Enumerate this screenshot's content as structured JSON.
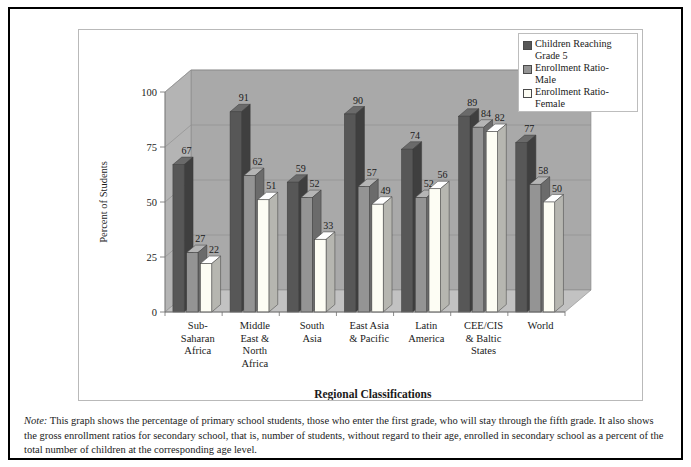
{
  "figure": {
    "x_axis_title": "Regional Classifications",
    "y_axis_title": "Percent of Students",
    "note_label": "Note:",
    "note_text": " This graph shows the percentage of primary school students, those who enter the first grade, who will stay through the fifth grade. It also shows the gross enrollment ratios for secondary school, that is, number of students, without regard to their age, enrolled in secondary school as a percent of the total number of children at the corresponding age level."
  },
  "legend": {
    "items": [
      {
        "label": "Children Reaching\nGrade 5",
        "color": "#575757",
        "name": "legend-children-reaching-grade-5"
      },
      {
        "label": "Enrollment Ratio-\nMale",
        "color": "#949494",
        "name": "legend-enrollment-ratio-male"
      },
      {
        "label": "Enrollment Ratio-\nFemale",
        "color": "#fdfdf4",
        "name": "legend-enrollment-ratio-female"
      }
    ]
  },
  "chart_data": {
    "type": "bar",
    "title": "",
    "subtitle": "",
    "xlabel": "Regional Classifications",
    "ylabel": "Percent of Students",
    "ylim": [
      0,
      100
    ],
    "yticks": [
      0,
      25,
      50,
      75,
      100
    ],
    "ytick_labels": [
      "0",
      "25",
      "50",
      "75",
      "100"
    ],
    "grid": true,
    "legend_position": "top-right",
    "three_d": true,
    "categories": [
      "Sub-\nSaharan\nAfrica",
      "Middle\nEast &\nNorth\nAfrica",
      "South\nAsia",
      "East Asia\n& Pacific",
      "Latin\nAmerica",
      "CEE/CIS\n& Baltic\nStates",
      "World"
    ],
    "series": [
      {
        "name": "Children Reaching Grade 5",
        "color": "#575757",
        "values": [
          67,
          91,
          59,
          90,
          74,
          89,
          77
        ]
      },
      {
        "name": "Enrollment Ratio-Male",
        "color": "#949494",
        "values": [
          27,
          62,
          52,
          57,
          52,
          84,
          58
        ]
      },
      {
        "name": "Enrollment Ratio-Female",
        "color": "#fdfdf4",
        "values": [
          22,
          51,
          33,
          49,
          56,
          82,
          50
        ]
      }
    ],
    "colors": {
      "plot_wall": "#a9a9a9",
      "plot_floor": "#c2c2c2",
      "gridline": "#909090",
      "bar_dark": "#575757",
      "bar_mid": "#949494",
      "bar_light": "#fdfdf4"
    }
  }
}
